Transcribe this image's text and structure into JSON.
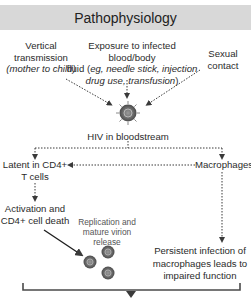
{
  "title": "Pathophysiology",
  "sources": {
    "vertical": {
      "line1": "Vertical",
      "line2": "transmission",
      "line3": "(mother to child)"
    },
    "blood": {
      "line1": "Exposure to infected blood/body",
      "line2_plain": "fluid (",
      "line2_italic": "eg, needle stick, injection",
      "line3_italic": "drug use, transfusion",
      "line3_plain": ")"
    },
    "sexual": {
      "line1": "Sexual",
      "line2": "contact"
    }
  },
  "hub": {
    "label": "HIV in bloodstream",
    "icon": "hiv-virion-icon"
  },
  "branches": {
    "latent": {
      "line1": "Latent in CD4+",
      "line2": "T cells"
    },
    "macrophages": {
      "label": "Macrophages"
    },
    "activation": {
      "line1": "Activation and",
      "line2": "CD4+ cell death"
    },
    "replication": {
      "line1": "Replication and",
      "line2": "mature virion",
      "line3": "release"
    },
    "persistent": {
      "line1": "Persistent infection of",
      "line2": "macrophages leads to",
      "line3": "impaired function"
    }
  },
  "colors": {
    "header_bg": "#d8d8d8",
    "text": "#2b2b2b",
    "arrow": "#3a3a3a",
    "virion": "#6e6e6e"
  }
}
